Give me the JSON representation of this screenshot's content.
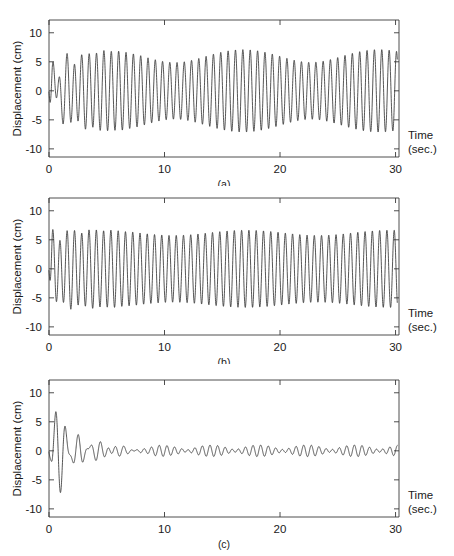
{
  "figure": {
    "axis": {
      "ylabel": "Displacement (cm)",
      "xlabel_line1": "Time",
      "xlabel_line2": "(sec.)",
      "yticks": [
        "10",
        "5",
        "0",
        "-5",
        "-10"
      ],
      "ytick_values": [
        10,
        5,
        0,
        -5,
        -10
      ],
      "xticks": [
        "0",
        "10",
        "20",
        "30"
      ],
      "xtick_values": [
        0,
        10,
        20,
        30
      ],
      "ylim": [
        -11.4,
        12.2
      ],
      "xlim": [
        0,
        30.3
      ],
      "grid": false,
      "line_color": "#2b2b2b",
      "axis_color": "#3a3a3a",
      "background": "#ffffff"
    },
    "panels": [
      {
        "id": "a",
        "label": "(a)"
      },
      {
        "id": "b",
        "label": "(b)"
      },
      {
        "id": "c",
        "label": "(c)"
      }
    ]
  },
  "chart_data": [
    {
      "type": "line",
      "panel": "(a)",
      "title": "",
      "xlabel": "Time (sec.)",
      "ylabel": "Displacement (cm)",
      "xlim": [
        0,
        30.3
      ],
      "ylim": [
        -11.4,
        12.2
      ],
      "xticks": [
        0,
        10,
        20,
        30
      ],
      "yticks": [
        -10,
        -5,
        0,
        5,
        10
      ],
      "grid": false,
      "description": "Lightly damped beating response: large initial transient reaching +10.2 / -10.6 cm near t=2-3 s, settling into a sustained beating oscillation of about 5.5-7 cm amplitude for the rest of the record, with a beat minimum near t=17-18 s and a beat maximum near t=26-27 s.",
      "model": {
        "kind": "beating_sum_of_sinusoids",
        "components": [
          {
            "amp": 6.0,
            "freq_hz": 1.58,
            "phase_deg": -96
          },
          {
            "amp": 1.1,
            "freq_hz": 1.495,
            "phase_deg": 58
          }
        ],
        "transient": {
          "amp": 5.6,
          "freq_hz": 0.94,
          "phase_deg": -88,
          "decay_tau": 1.25
        },
        "transient2": {
          "amp": 2.2,
          "freq_hz": 1.58,
          "phase_deg": 60,
          "decay_tau": 2.4
        },
        "start_value": -0.2
      },
      "peaks": [
        {
          "t": 0.25,
          "y": -3.6
        },
        {
          "t": 0.85,
          "y": 6.6
        },
        {
          "t": 1.3,
          "y": -8.1
        },
        {
          "t": 1.85,
          "y": 10.2
        },
        {
          "t": 2.35,
          "y": -10.6
        },
        {
          "t": 2.85,
          "y": 10.1
        },
        {
          "t": 3.35,
          "y": -8.3
        },
        {
          "t": 3.8,
          "y": 6.7
        },
        {
          "t": 4.3,
          "y": -5.6
        },
        {
          "t": 4.75,
          "y": 4.7
        },
        {
          "t": 5.3,
          "y": -5.6
        },
        {
          "t": 5.75,
          "y": 5.7
        },
        {
          "t": 17.5,
          "y": 4.4
        },
        {
          "t": 26.8,
          "y": 7.1
        },
        {
          "t": 30.0,
          "y": -6.4
        }
      ]
    },
    {
      "type": "line",
      "panel": "(b)",
      "title": "",
      "xlabel": "Time (sec.)",
      "ylabel": "Displacement (cm)",
      "xlim": [
        0,
        30.3
      ],
      "ylim": [
        -11.4,
        12.2
      ],
      "xticks": [
        0,
        10,
        20,
        30
      ],
      "yticks": [
        -10,
        -5,
        0,
        5,
        10
      ],
      "grid": false,
      "description": "Nearly steady-state harmonic response: small start-up transient peaking at about +8 cm near t=1.8 s, then a sustained oscillation of roughly 6 to 6.8 cm amplitude for the full 30 s with only a mild beat modulation.",
      "model": {
        "kind": "steady_with_small_transient",
        "components": [
          {
            "amp": 6.2,
            "freq_hz": 1.59,
            "phase_deg": -96
          },
          {
            "amp": 0.45,
            "freq_hz": 1.51,
            "phase_deg": 35
          }
        ],
        "transient": {
          "amp": 2.0,
          "freq_hz": 1.05,
          "phase_deg": -85,
          "decay_tau": 1.6
        },
        "start_value": -0.3
      },
      "peaks": [
        {
          "t": 0.3,
          "y": -3.7
        },
        {
          "t": 0.85,
          "y": 6.0
        },
        {
          "t": 1.35,
          "y": -7.5
        },
        {
          "t": 1.85,
          "y": 8.0
        },
        {
          "t": 2.3,
          "y": -7.6
        },
        {
          "t": 2.8,
          "y": 7.1
        },
        {
          "t": 3.3,
          "y": -6.5
        },
        {
          "t": 15.0,
          "y": 6.3
        },
        {
          "t": 27.0,
          "y": 6.7
        },
        {
          "t": 30.0,
          "y": 1.6
        }
      ]
    },
    {
      "type": "line",
      "panel": "(c)",
      "title": "",
      "xlabel": "Time (sec.)",
      "ylabel": "Displacement (cm)",
      "xlim": [
        0,
        30.3
      ],
      "ylim": [
        -11.4,
        12.2
      ],
      "xticks": [
        0,
        10,
        20,
        30
      ],
      "yticks": [
        -10,
        -5,
        0,
        5,
        10
      ],
      "grid": false,
      "description": "Strongly damped / controlled response: initial transient peaks at about +7.5 / -7.5 cm near t=1.5-2.5 s, decays rapidly to under 1 cm by t=7 s, then a very small residual beating ripple (about 0.4 to 1.3 cm) persists, growing slightly near t=26-28 s.",
      "model": {
        "kind": "damped_transient_plus_small_residual",
        "transient": {
          "amp": 7.6,
          "freq_hz": 1.0,
          "phase_deg": -92,
          "decay_tau": 1.9
        },
        "transient2": {
          "amp": 3.4,
          "freq_hz": 1.62,
          "phase_deg": 70,
          "decay_tau": 2.6
        },
        "residual": [
          {
            "amp": 0.62,
            "freq_hz": 1.6,
            "phase_deg": -20
          },
          {
            "amp": 0.38,
            "freq_hz": 1.36,
            "phase_deg": 110
          }
        ],
        "start_value": -0.2
      },
      "peaks": [
        {
          "t": 0.3,
          "y": -3.2
        },
        {
          "t": 0.8,
          "y": 5.4
        },
        {
          "t": 1.2,
          "y": -7.4
        },
        {
          "t": 1.7,
          "y": 7.5
        },
        {
          "t": 2.2,
          "y": -7.2
        },
        {
          "t": 2.65,
          "y": 6.1
        },
        {
          "t": 3.1,
          "y": -4.6
        },
        {
          "t": 3.6,
          "y": 3.3
        },
        {
          "t": 4.1,
          "y": -2.6
        },
        {
          "t": 4.6,
          "y": 2.3
        },
        {
          "t": 5.6,
          "y": 1.9
        },
        {
          "t": 7.0,
          "y": 1.1
        },
        {
          "t": 12.0,
          "y": 0.8
        },
        {
          "t": 18.5,
          "y": 0.45
        },
        {
          "t": 26.5,
          "y": 1.5
        },
        {
          "t": 30.0,
          "y": -0.4
        }
      ]
    }
  ]
}
